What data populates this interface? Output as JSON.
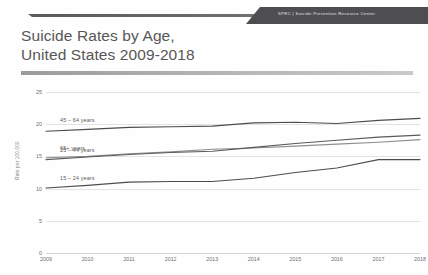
{
  "header": {
    "brand_abbr": "SPRC",
    "brand_sep": "|",
    "brand_name": "Suicide Prevention Resource Center",
    "brand_full": "SPRC | Suicide Prevention Resource Center",
    "banner_color": "#4e4e50"
  },
  "slide": {
    "title_line1": "Suicide Rates by Age,",
    "title_line2": "United States 2009-2018",
    "divider_color": "#a8a8ab"
  },
  "chart_data": {
    "type": "line",
    "title": "Suicide Rates by Age, United States 2009-2018",
    "xlabel": "",
    "ylabel": "Rate per 100,000",
    "x": [
      2009,
      2010,
      2011,
      2012,
      2013,
      2014,
      2015,
      2016,
      2017,
      2018
    ],
    "xtick_labels": [
      "2009",
      "2010",
      "2011",
      "2012",
      "2013",
      "2014",
      "2015",
      "2016",
      "2017",
      "2018"
    ],
    "ytick_labels": [
      "0",
      "5",
      "10",
      "15",
      "20",
      "25"
    ],
    "yticks": [
      0,
      5,
      10,
      15,
      20,
      25
    ],
    "ylim": [
      0,
      25
    ],
    "xlim": [
      2009,
      2018
    ],
    "grid": true,
    "legend": "inline-labels",
    "series": [
      {
        "name": "45 – 64 years",
        "label": "45 – 64 years",
        "color": "#4d4d4d",
        "values": [
          18.9,
          19.2,
          19.5,
          19.6,
          19.7,
          20.2,
          20.3,
          20.1,
          20.6,
          20.9
        ]
      },
      {
        "name": "65+ years",
        "label": "65+ years",
        "color": "#8e8e90",
        "values": [
          14.8,
          15.0,
          15.4,
          15.7,
          16.1,
          16.3,
          16.6,
          16.9,
          17.2,
          17.6
        ]
      },
      {
        "name": "25 – 44 years",
        "label": "25 – 44 years",
        "color": "#5a5a5a",
        "values": [
          14.5,
          14.9,
          15.3,
          15.6,
          15.8,
          16.4,
          17.0,
          17.5,
          18.0,
          18.3
        ]
      },
      {
        "name": "15 – 24 years",
        "label": "15 – 24 years",
        "color": "#4d4d4d",
        "values": [
          10.1,
          10.5,
          11.0,
          11.1,
          11.1,
          11.6,
          12.5,
          13.2,
          14.5,
          14.5
        ]
      }
    ]
  }
}
